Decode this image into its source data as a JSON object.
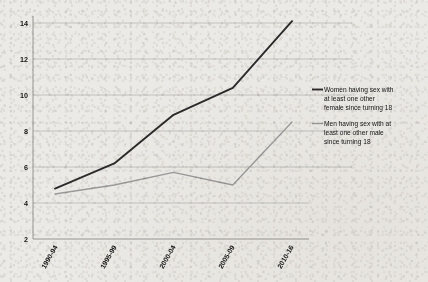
{
  "chart_data": {
    "type": "line",
    "title": "",
    "subtitle": "",
    "xlabel": "",
    "ylabel": "",
    "categories": [
      "1990-94",
      "1995-99",
      "2000-04",
      "2005-09",
      "2010-16"
    ],
    "series": [
      {
        "name": "Women having sex with at least one other female since turning 18",
        "color": "#2b2b2b",
        "values": [
          4.8,
          6.2,
          8.9,
          10.4,
          14.1
        ]
      },
      {
        "name": "Men having sex with at least one other male since turning 18",
        "color": "#9a9a9a",
        "values": [
          4.5,
          5.0,
          5.7,
          5.0,
          8.5
        ]
      }
    ],
    "ylim": [
      2,
      15
    ],
    "yticks": [
      2,
      4,
      6,
      8,
      10,
      12,
      14
    ],
    "ytick_labels": [
      "2",
      "4",
      "6",
      "8",
      "10",
      "12",
      "14"
    ],
    "grid": "horizontal",
    "legend_position": "right"
  },
  "legend": {
    "entries": [
      {
        "label": "Women having sex with at least one other female since turning 18"
      },
      {
        "label": "Men having sex with at least one other male since turning 18"
      }
    ]
  }
}
